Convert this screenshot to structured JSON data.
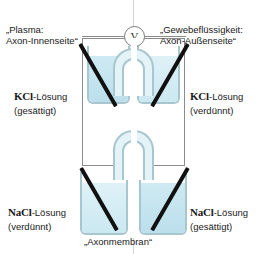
{
  "diagram": {
    "meter": {
      "symbol": "V",
      "name": "voltmeter"
    },
    "membrane_label": "„Axonmembran“",
    "side_labels": {
      "left": {
        "line1": "„Plasma:",
        "line2": "Axon-Innenseite“"
      },
      "right": {
        "line1": "„Gewebeflüssigkeit:",
        "line2": "Axon-Außenseite“"
      }
    },
    "solutions": [
      {
        "id": "kcl-left",
        "chem": "KCl",
        "suffix": "-Lösung",
        "state": "(gesättigt)"
      },
      {
        "id": "kcl-right",
        "chem": "KCl",
        "suffix": "-Lösung",
        "state": "(verdünnt)"
      },
      {
        "id": "nacl-left",
        "chem": "NaCl",
        "suffix": "-Lösung",
        "state": "(verdünnt)"
      },
      {
        "id": "nacl-right",
        "chem": "NaCl",
        "suffix": "-Lösung",
        "state": "(gesättigt)"
      }
    ],
    "colors": {
      "liquid": "#c3e4ef",
      "glass": "#a8c6ce",
      "electrode": "#111111",
      "frame": "#8c8c8c",
      "background": "#ffffff"
    }
  }
}
